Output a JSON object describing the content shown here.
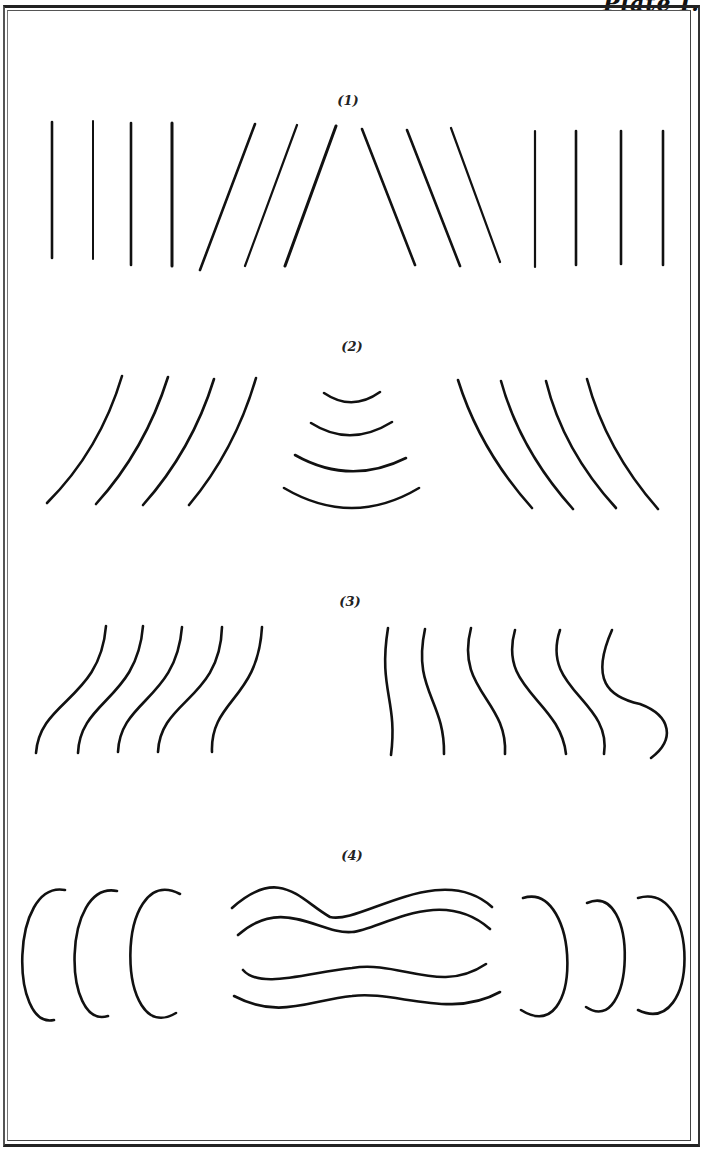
{
  "plate": {
    "label": "Plate I."
  },
  "figures": [
    {
      "label": "(1)",
      "description": "straight parallel lines: vertical group, inclined pair of groups meeting at apex, vertical group"
    },
    {
      "label": "(2)",
      "description": "curved arcs: left-leaning arcs, concentric arcs opening upward, right-leaning arcs"
    },
    {
      "label": "(3)",
      "description": "S-shaped wavy lines: five left-tilted waves, six increasingly curved waves"
    },
    {
      "label": "(4)",
      "description": "left-opening bracket arcs, four undulating horizontal waves, right-closing bracket arcs"
    }
  ],
  "colors": {
    "ink": "#111111",
    "paper": "#ffffff"
  }
}
